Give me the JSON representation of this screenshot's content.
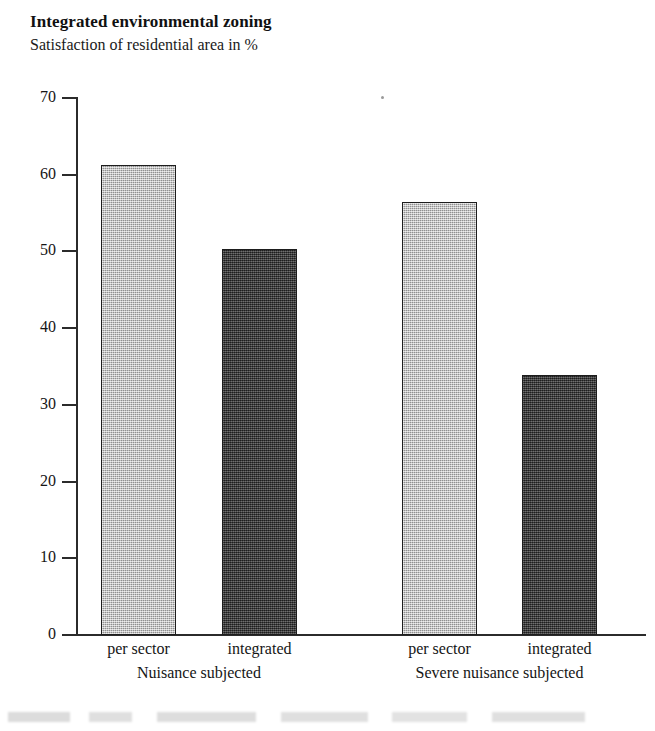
{
  "header": {
    "title": "Integrated environmental zoning",
    "subtitle": "Satisfaction of residential area in %"
  },
  "chart_data": {
    "type": "bar",
    "title": "Integrated environmental zoning",
    "subtitle": "Satisfaction of residential area in %",
    "xlabel": "",
    "ylabel": "",
    "ylim": [
      0,
      70
    ],
    "yticks": [
      0,
      10,
      20,
      30,
      40,
      50,
      60,
      70
    ],
    "ytick_labels": [
      "0",
      "10",
      "20",
      "30",
      "40",
      "50",
      "60",
      "70"
    ],
    "grid": false,
    "legend": "none",
    "groups": [
      "Nuisance subjected",
      "Severe nuisance subjected"
    ],
    "categories": [
      "per sector",
      "integrated"
    ],
    "series": [
      {
        "name": "per sector",
        "values": [
          61.3,
          56.4
        ],
        "fill": "light-gray-stipple",
        "color": "#b6b6b6"
      },
      {
        "name": "integrated",
        "values": [
          50.3,
          33.9
        ],
        "fill": "dark-gray-stipple",
        "color": "#3b3b3b"
      }
    ],
    "bars": [
      {
        "group": "Nuisance subjected",
        "category": "per sector",
        "value": 61.3,
        "style": "light"
      },
      {
        "group": "Nuisance subjected",
        "category": "integrated",
        "value": 50.3,
        "style": "dark"
      },
      {
        "group": "Severe nuisance subjected",
        "category": "per sector",
        "value": 56.4,
        "style": "light"
      },
      {
        "group": "Severe nuisance subjected",
        "category": "integrated",
        "value": 33.9,
        "style": "dark"
      }
    ],
    "axis_color": "#2b2b2b"
  }
}
